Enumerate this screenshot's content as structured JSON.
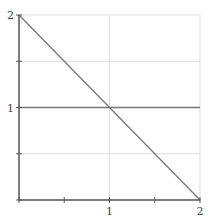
{
  "chart_data": {
    "type": "line",
    "title": "",
    "xlabel": "",
    "ylabel": "",
    "xlim": [
      0,
      2
    ],
    "ylim": [
      0,
      2
    ],
    "grid": true,
    "legend": null,
    "x_ticks": [
      0,
      0.5,
      1,
      1.5,
      2
    ],
    "x_tick_labels": [
      "",
      "",
      "1",
      "",
      "2"
    ],
    "y_ticks": [
      0,
      0.5,
      1,
      1.5,
      2
    ],
    "y_tick_labels": [
      "",
      "",
      "1",
      "",
      "2"
    ],
    "gridlines_x": [
      1,
      2
    ],
    "gridlines_y": [
      0.5,
      1,
      1.5,
      2
    ],
    "series": [
      {
        "name": "decreasing line",
        "x": [
          0,
          2
        ],
        "y": [
          2,
          0
        ],
        "color": "#777777"
      },
      {
        "name": "horizontal line",
        "x": [
          0,
          2
        ],
        "y": [
          1,
          1
        ],
        "color": "#777777"
      }
    ]
  },
  "colors": {
    "axis": "#555555",
    "grid": "#dddddd",
    "series": "#777777",
    "text": "#444444"
  }
}
